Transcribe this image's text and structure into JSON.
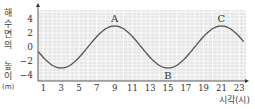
{
  "chart_data": {
    "type": "line",
    "title": "",
    "xlabel": "시각(시)",
    "ylabel": "해수면의 높이(m)",
    "ylabel_chars": [
      "해",
      "수",
      "면",
      "의",
      " ",
      "높",
      "이",
      "(m)"
    ],
    "x_ticks": [
      1,
      3,
      5,
      7,
      9,
      11,
      13,
      15,
      17,
      19,
      21,
      23
    ],
    "y_ticks": [
      4,
      2,
      0,
      -2,
      -4
    ],
    "xlim": [
      0,
      24
    ],
    "ylim": [
      -5,
      5
    ],
    "grid": true,
    "series": [
      {
        "name": "해수면의 높이",
        "x": [
          0,
          1,
          2,
          3,
          4,
          5,
          6,
          7,
          8,
          9,
          10,
          11,
          12,
          13,
          14,
          15,
          16,
          17,
          18,
          19,
          20,
          21,
          22,
          23,
          24
        ],
        "values": [
          0,
          -1.5,
          -2.6,
          -3,
          -2.6,
          -1.5,
          0,
          1.5,
          2.6,
          3,
          2.6,
          1.5,
          0,
          -1.5,
          -2.6,
          -3,
          -2.6,
          -1.5,
          0,
          1.5,
          2.6,
          3,
          2.6,
          1.5,
          0
        ]
      }
    ],
    "annotations": [
      {
        "label": "A",
        "x": 9,
        "y": 3,
        "position": "above"
      },
      {
        "label": "B",
        "x": 15,
        "y": -3,
        "position": "below"
      },
      {
        "label": "C",
        "x": 21,
        "y": 3,
        "position": "above"
      }
    ],
    "colors": {
      "background": "#e6e6e6",
      "grid": "#ffffff",
      "line": "#555555",
      "axis": "#333333"
    }
  }
}
